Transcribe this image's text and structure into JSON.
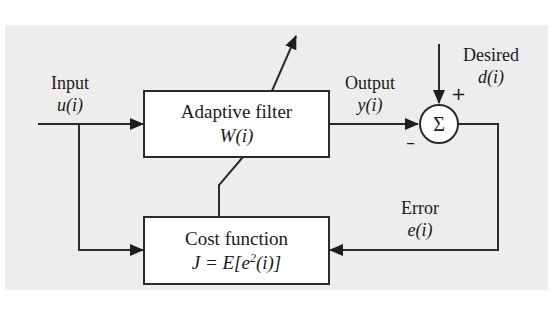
{
  "diagram": {
    "colors": {
      "background_panel": "#ededed",
      "line": "#2b2b2b",
      "box_fill": "#ffffff"
    },
    "nodes": {
      "adaptive_filter": {
        "name": "Adaptive filter",
        "expr": "W(i)"
      },
      "cost_function": {
        "name": "Cost function",
        "expr_prefix": "J = E[e",
        "expr_sup": "2",
        "expr_suffix": "(i)]"
      },
      "summer": {
        "symbol": "Σ",
        "plus_sign": "+",
        "minus_sign": "–"
      }
    },
    "signals": {
      "input": {
        "label": "Input",
        "expr": "u(i)"
      },
      "output": {
        "label": "Output",
        "expr": "y(i)"
      },
      "desired": {
        "label": "Desired",
        "expr": "d(i)"
      },
      "error": {
        "label": "Error",
        "expr": "e(i)"
      }
    },
    "edges": [
      {
        "from": "input",
        "to": "adaptive_filter"
      },
      {
        "from": "input",
        "to": "cost_function"
      },
      {
        "from": "adaptive_filter",
        "to": "summer",
        "sign": "-"
      },
      {
        "from": "desired",
        "to": "summer",
        "sign": "+"
      },
      {
        "from": "summer",
        "to": "cost_function",
        "signal": "error"
      },
      {
        "from": "cost_function",
        "to": "adaptive_filter",
        "type": "adaptation (diagonal arrow)"
      }
    ]
  }
}
